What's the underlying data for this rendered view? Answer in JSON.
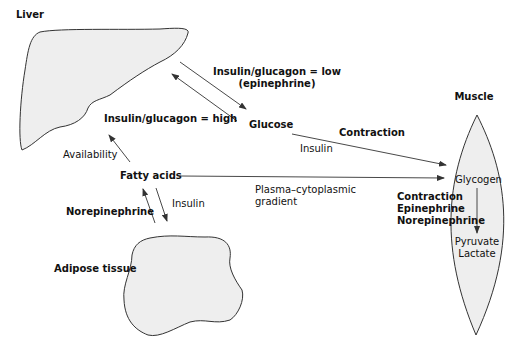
{
  "organs": {
    "liver": "Liver",
    "muscle": "Muscle",
    "adipose": "Adipose tissue"
  },
  "substrates": {
    "glucose": "Glucose",
    "fatty_acids": "Fatty acids",
    "glycogen": "Glycogen",
    "pyruvate": "Pyruvate",
    "lactate": "Lactate"
  },
  "labels": {
    "liver_to_glucose_line1": "Insulin/glucagon = low",
    "liver_to_glucose_line2": "(epinephrine)",
    "glucose_to_liver": "Insulin/glucagon = high",
    "availability": "Availability",
    "contraction_top": "Contraction",
    "insulin_glucose": "Insulin",
    "insulin_fa": "Insulin",
    "norepinephrine": "Norepinephrine",
    "plasma_line1": "Plasma–cytoplasmic",
    "plasma_line2": "gradient",
    "glycogenolysis_line1": "Contraction",
    "glycogenolysis_line2": "Epinephrine",
    "glycogenolysis_line3": "Norepinephrine"
  },
  "colors": {
    "organ_fill": "#eeeeee",
    "stroke": "#333333"
  }
}
